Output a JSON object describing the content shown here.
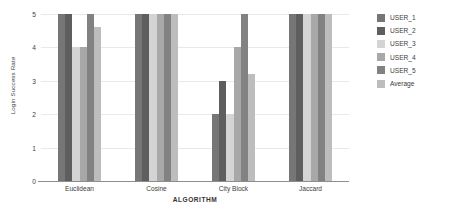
{
  "chart_data": {
    "type": "bar",
    "title": "",
    "subtitle": "",
    "xlabel": "ALGORITHM",
    "ylabel": "Login Success Rate",
    "categories": [
      "Euclidean",
      "Cosine",
      "City Block",
      "Jaccard"
    ],
    "series": [
      {
        "name": "USER_1",
        "color": "#767676",
        "values": [
          5,
          5,
          2,
          5
        ]
      },
      {
        "name": "USER_2",
        "color": "#5e5e5e",
        "values": [
          5,
          5,
          3,
          5
        ]
      },
      {
        "name": "USER_3",
        "color": "#d4d4d4",
        "values": [
          4,
          5,
          2,
          5
        ]
      },
      {
        "name": "USER_4",
        "color": "#a8a8a8",
        "values": [
          4,
          5,
          4,
          5
        ]
      },
      {
        "name": "USER_5",
        "color": "#828282",
        "values": [
          5,
          5,
          5,
          5
        ]
      },
      {
        "name": "Average",
        "color": "#bdbdbd",
        "values": [
          4.6,
          5,
          3.2,
          5
        ]
      }
    ],
    "ylim": [
      0,
      5
    ],
    "yticks": [
      0,
      1,
      2,
      3,
      4,
      5
    ],
    "ytick_labels": [
      "0",
      "1",
      "2",
      "3",
      "4",
      "5"
    ],
    "grid": true,
    "grid_axis": "y",
    "legend_position": "right",
    "background_color": "#ffffff",
    "axis_color": "#8d8d8d",
    "grid_color": "#e9e9e9"
  }
}
